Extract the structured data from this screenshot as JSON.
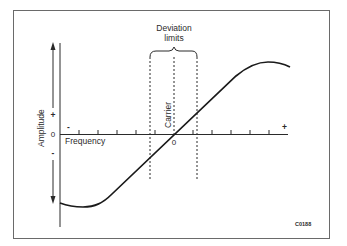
{
  "diagram": {
    "title_label": "Deviation",
    "title_label_line2": "limits",
    "carrier_label": "Carrier",
    "x_axis_label": "Frequency",
    "x_axis_minus": "-",
    "x_axis_plus": "+",
    "x_axis_zero": "0",
    "y_axis_label": "Amplitude",
    "y_axis_plus": "+",
    "y_axis_zero": "0",
    "y_axis_minus": "-",
    "figure_code": "C0188",
    "colors": {
      "line": "#1a1a1a",
      "border": "#6a6a6a",
      "background": "#ffffff"
    }
  }
}
